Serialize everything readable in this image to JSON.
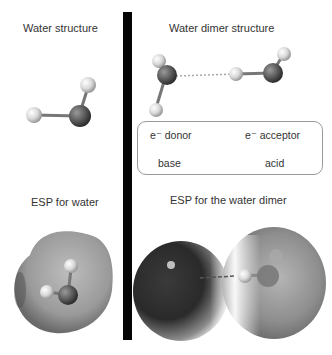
{
  "panels": {
    "water_structure": {
      "title": "Water structure"
    },
    "water_dimer_structure": {
      "title": "Water dimer structure",
      "box": {
        "donor_label": "e⁻ donor",
        "acceptor_label": "e⁻ acceptor",
        "base_label": "base",
        "acid_label": "acid"
      }
    },
    "esp_water": {
      "title": "ESP for water"
    },
    "esp_dimer": {
      "title": "ESP for the water dimer"
    }
  },
  "colors": {
    "oxygen": "#5a5a5a",
    "hydrogen": "#d8d8d8",
    "divider": "#050505",
    "box_border": "#999999"
  }
}
